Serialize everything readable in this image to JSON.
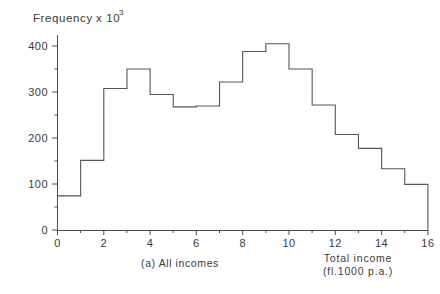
{
  "chart_data": {
    "type": "bar",
    "title": "",
    "subtitle": "",
    "caption": "(a) All incomes",
    "ylabel": "Frequency",
    "ylabel_suffix": "x 10",
    "ylabel_exponent": "3",
    "xlabel_line1": "Total income",
    "xlabel_line2": "(fl.1000 p.a.)",
    "xlim": [
      0,
      16
    ],
    "ylim": [
      0,
      430
    ],
    "grid": false,
    "legend": "none",
    "bin_width": 1,
    "bin_edges": [
      0,
      1,
      2,
      3,
      4,
      5,
      6,
      7,
      8,
      9,
      10,
      11,
      12,
      13,
      14,
      15,
      16
    ],
    "categories": [
      "0-1",
      "1-2",
      "2-3",
      "3-4",
      "4-5",
      "5-6",
      "6-7",
      "7-8",
      "8-9",
      "9-10",
      "10-11",
      "11-12",
      "12-13",
      "13-14",
      "14-15",
      "15-16"
    ],
    "values": [
      75,
      152,
      308,
      350,
      295,
      268,
      270,
      322,
      388,
      405,
      350,
      272,
      208,
      178,
      134,
      100
    ],
    "ytick_labels": [
      "0",
      "100",
      "200",
      "300",
      "400"
    ],
    "ytick_values": [
      0,
      100,
      200,
      300,
      400
    ],
    "xtick_labels": [
      "0",
      "2",
      "4",
      "6",
      "8",
      "10",
      "12",
      "14",
      "16"
    ],
    "xtick_values": [
      0,
      2,
      4,
      6,
      8,
      10,
      12,
      14,
      16
    ],
    "xminor_values": [
      1,
      3,
      5,
      7,
      9,
      11,
      13,
      15
    ],
    "color": "#555555",
    "background": "#ffffff"
  },
  "figure": {
    "origin_label": "0"
  }
}
